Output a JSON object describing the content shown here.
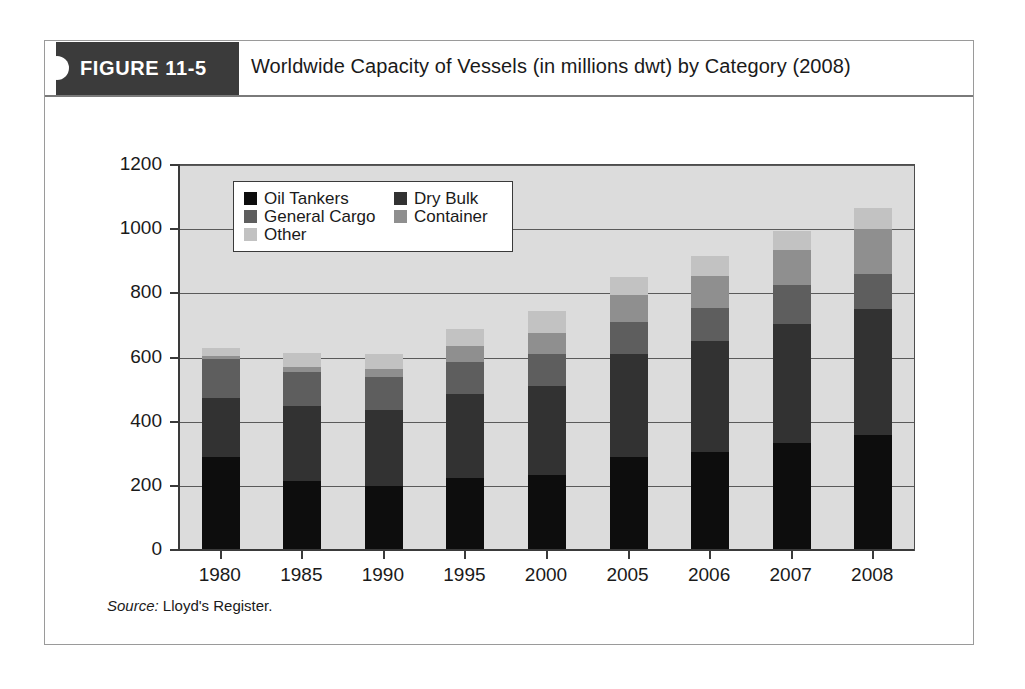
{
  "figure": {
    "tab_label": "FIGURE 11-5",
    "title": "Worldwide Capacity of Vessels (in millions dwt) by Category (2008)",
    "source_label": "Source:",
    "source_text": " Lloyd's Register."
  },
  "colors": {
    "oil_tankers": "#0d0d0d",
    "dry_bulk": "#323232",
    "general_cargo": "#5e5e5e",
    "container": "#8f8f8f",
    "other": "#c2c2c2",
    "plot_background": "#dcdcdc",
    "tab_background": "#3b3b3b",
    "axis": "#3a3a3a"
  },
  "chart_data": {
    "type": "bar",
    "stacked": true,
    "title": "Worldwide Capacity of Vessels (in millions dwt) by Category (2008)",
    "xlabel": "",
    "ylabel": "",
    "ylim": [
      0,
      1200
    ],
    "yticks": [
      0,
      200,
      400,
      600,
      800,
      1000,
      1200
    ],
    "ytick_labels": [
      "0",
      "200",
      "400",
      "600",
      "800",
      "1000",
      "1200"
    ],
    "grid": true,
    "legend_position": "upper-left-inside",
    "categories": [
      "1980",
      "1985",
      "1990",
      "1995",
      "2000",
      "2005",
      "2006",
      "2007",
      "2008"
    ],
    "series": [
      {
        "name": "Oil Tankers",
        "color": "#0d0d0d",
        "values": [
          290,
          215,
          200,
          225,
          235,
          290,
          305,
          335,
          360
        ]
      },
      {
        "name": "Dry Bulk",
        "color": "#323232",
        "values": [
          185,
          235,
          235,
          260,
          275,
          320,
          345,
          370,
          390
        ]
      },
      {
        "name": "General Cargo",
        "color": "#5e5e5e",
        "values": [
          120,
          105,
          105,
          100,
          100,
          100,
          105,
          120,
          110
        ]
      },
      {
        "name": "Container",
        "color": "#8f8f8f",
        "values": [
          10,
          15,
          25,
          50,
          65,
          85,
          100,
          110,
          140
        ]
      },
      {
        "name": "Other",
        "color": "#c2c2c2",
        "values": [
          25,
          45,
          45,
          55,
          70,
          55,
          60,
          60,
          65
        ]
      }
    ],
    "totals": [
      630,
      615,
      610,
      690,
      745,
      850,
      915,
      995,
      1065
    ]
  }
}
